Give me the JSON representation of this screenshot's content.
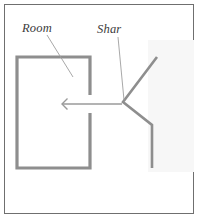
{
  "figure": {
    "background_color": "#ffffff",
    "frame": {
      "border_color": "#6f6f6f",
      "inset_px": 4,
      "width_px": 190,
      "height_px": 210
    },
    "shade_region": {
      "name": "right-shade-wash",
      "color": "#f7f7f7",
      "x": 148,
      "y": 40,
      "width": 46,
      "height": 132
    }
  },
  "labels": [
    {
      "id": "room",
      "text": "Room",
      "x": 22,
      "y": 32,
      "leader": {
        "x1": 47,
        "y1": 35,
        "x2": 73,
        "y2": 77
      }
    },
    {
      "id": "shar",
      "text": "Shar",
      "x": 97,
      "y": 33,
      "leader": {
        "x1": 118,
        "y1": 37,
        "x2": 124,
        "y2": 100
      }
    }
  ],
  "shapes": {
    "room": {
      "name": "room-outline",
      "stroke_color": "#8e8e8e",
      "stroke_width": 3.2,
      "left": 17,
      "top": 57,
      "right": 90,
      "bottom": 168,
      "aperture": {
        "wall": "right",
        "y_top": 95,
        "y_bottom": 113
      }
    },
    "wedge": {
      "name": "sharp-wedge-outline",
      "stroke_color": "#8e8e8e",
      "stroke_width": 2.6,
      "points": "157,57 123,102 152,125 152,168",
      "apex": {
        "x": 123,
        "y": 102
      }
    },
    "arrow": {
      "name": "incident-direction-arrow",
      "stroke_color": "#9a9a9a",
      "stroke_width": 1.4,
      "tail_x": 122,
      "head_x": 62,
      "y": 104,
      "direction": "left",
      "head_size": 5.5
    }
  },
  "colors": {
    "wall_gray": "#8e8e8e",
    "frame_gray": "#6f6f6f",
    "text_gray": "#3b3b3b",
    "leader_gray": "#9e9e9e",
    "shade_gray": "#f7f7f7"
  }
}
